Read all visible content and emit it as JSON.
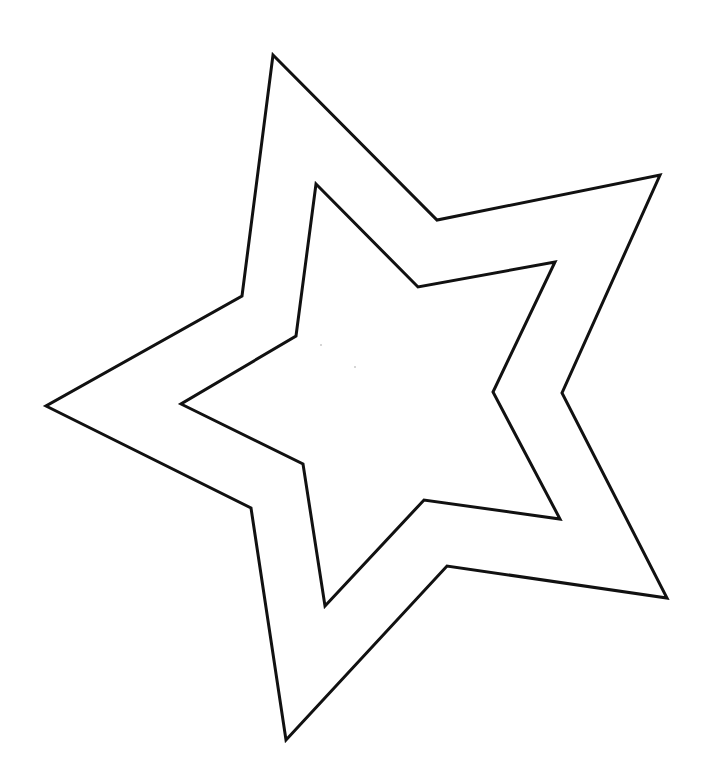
{
  "drawing": {
    "background": "#ffffff",
    "stroke_color": "#111111",
    "stroke_width": 3,
    "shapes": [
      {
        "name": "outer-star",
        "points": "273,55 437,220 660,175 562,393 667,598 447,566 286,740 251,508 46,406 242,296"
      },
      {
        "name": "inner-star",
        "points": "316,184 418,287 555,262 493,392 560,519 424,500 325,606 303,464 181,404 296,336"
      }
    ],
    "specks": [
      {
        "cx": 321,
        "cy": 345,
        "r": 1
      },
      {
        "cx": 355,
        "cy": 367,
        "r": 1
      }
    ]
  }
}
